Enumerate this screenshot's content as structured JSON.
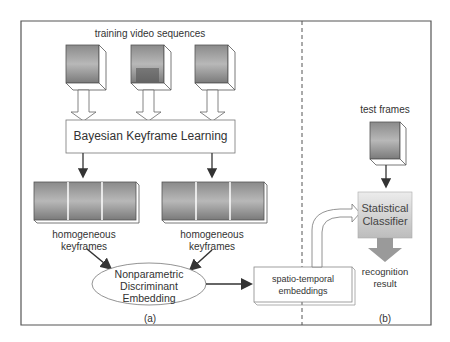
{
  "panel_a": {
    "label": "(a)",
    "training_title": "training video sequences",
    "bayesian_box": "Bayesian Keyframe Learning",
    "keyframes_left": [
      "homogeneous",
      "keyframes"
    ],
    "keyframes_right": [
      "homogeneous",
      "keyframes"
    ],
    "ellipse": [
      "Nonparametric",
      "Discriminant",
      "Embedding"
    ],
    "embeddings_box": [
      "spatio-temporal",
      "embeddings"
    ]
  },
  "panel_b": {
    "label": "(b)",
    "test_title": "test frames",
    "classifier": [
      "Statistical",
      "Classifier"
    ],
    "result": [
      "recognition",
      "result"
    ]
  },
  "colors": {
    "border": "#555555",
    "arrow_fill": "#ffffff",
    "classifier_top": "#e6e6e6",
    "classifier_bottom": "#bdbdbd",
    "output_arrow": "#9a9a9a"
  }
}
